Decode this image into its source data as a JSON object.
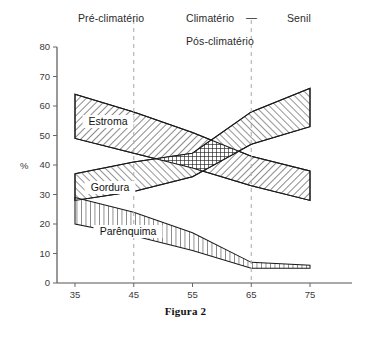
{
  "figure": {
    "caption": "Figura 2"
  },
  "phases": [
    {
      "key": "pre",
      "label": "Pré-climatério"
    },
    {
      "key": "clim",
      "label": "Climatério"
    },
    {
      "key": "dash",
      "label": "—"
    },
    {
      "key": "senil",
      "label": "Senil"
    },
    {
      "key": "pos",
      "label": "Pós-climatério"
    }
  ],
  "chart_data": {
    "type": "area",
    "title": "Figura 2",
    "xlabel": "",
    "ylabel": "%",
    "xlim": [
      30,
      80
    ],
    "ylim": [
      0,
      80
    ],
    "grid": false,
    "legend_position": "inline-labels",
    "xticks": [
      35,
      45,
      55,
      65,
      75
    ],
    "yticks": [
      0,
      10,
      20,
      30,
      40,
      50,
      60,
      70,
      80
    ],
    "x": [
      35,
      45,
      55,
      65,
      75
    ],
    "annotations": [
      {
        "text": "Pré-climatério",
        "x_range": [
          30,
          45
        ]
      },
      {
        "text": "Climatério",
        "x_range": [
          45,
          65
        ]
      },
      {
        "text": "Pós-climatério",
        "x_range": [
          45,
          65
        ]
      },
      {
        "text": "Senil",
        "x_range": [
          65,
          80
        ]
      }
    ],
    "vertical_dividers": [
      45,
      65
    ],
    "series": [
      {
        "name": "Estroma",
        "hatch": "diagonal-down",
        "upper": [
          64,
          58,
          51,
          43,
          38
        ],
        "lower": [
          49,
          44,
          39,
          33,
          28
        ]
      },
      {
        "name": "Gordura",
        "hatch": "diagonal-up",
        "upper": [
          37,
          41,
          44,
          58,
          66
        ],
        "lower": [
          28,
          31,
          36,
          47,
          53
        ]
      },
      {
        "name": "Parênquima",
        "hatch": "vertical",
        "upper": [
          29,
          24,
          17,
          7,
          6
        ],
        "lower": [
          20,
          16,
          11,
          5,
          5
        ]
      }
    ]
  }
}
